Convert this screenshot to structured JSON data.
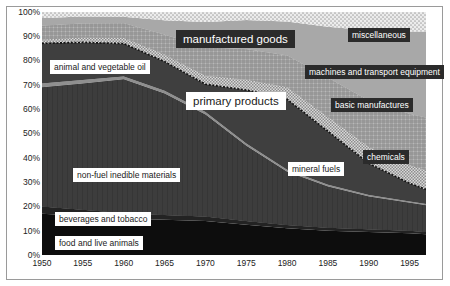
{
  "chart_data": {
    "type": "area",
    "title": "",
    "subtitle": "",
    "xlabel": "",
    "ylabel": "",
    "stacked": "100%",
    "grid": false,
    "legend_position": "inline-annotations",
    "xlim": [
      1950,
      1997
    ],
    "ylim": [
      0,
      100
    ],
    "x": [
      1950,
      1955,
      1960,
      1965,
      1970,
      1975,
      1980,
      1985,
      1990,
      1995,
      1997
    ],
    "xticks": [
      "1950",
      "1955",
      "1960",
      "1965",
      "1970",
      "1975",
      "1980",
      "1985",
      "1990",
      "1995"
    ],
    "ytick_labels": [
      "0%",
      "10%",
      "20%",
      "30%",
      "40%",
      "50%",
      "60%",
      "70%",
      "80%",
      "90%",
      "100%"
    ],
    "yticks": [
      0,
      10,
      20,
      30,
      40,
      50,
      60,
      70,
      80,
      90,
      100
    ],
    "series": [
      {
        "name": "food and live animals",
        "group": "primary products",
        "values": [
          17.0,
          16.0,
          15.0,
          14.5,
          14.0,
          12.5,
          11.0,
          10.0,
          9.5,
          9.0,
          8.5
        ]
      },
      {
        "name": "beverages and tobacco",
        "group": "primary products",
        "values": [
          3.0,
          2.6,
          2.3,
          2.0,
          1.8,
          1.5,
          1.3,
          1.2,
          1.1,
          1.0,
          1.0
        ]
      },
      {
        "name": "non-fuel inedible materials",
        "group": "primary products",
        "values": [
          49.0,
          52.0,
          55.0,
          50.0,
          42.0,
          31.0,
          22.0,
          17.0,
          13.5,
          11.5,
          11.0
        ]
      },
      {
        "name": "animal and vegetable oil",
        "group": "primary products",
        "values": [
          1.6,
          1.4,
          1.2,
          1.1,
          1.0,
          0.9,
          0.8,
          0.7,
          0.6,
          0.5,
          0.5
        ]
      },
      {
        "name": "mineral fuels",
        "group": "primary products",
        "values": [
          16.5,
          15.5,
          13.5,
          12.0,
          11.5,
          22.0,
          29.0,
          22.0,
          13.0,
          7.5,
          6.0
        ]
      },
      {
        "name": "chemicals",
        "group": "manufactured goods",
        "values": [
          1.6,
          2.0,
          2.4,
          3.0,
          3.6,
          4.3,
          5.0,
          6.0,
          6.8,
          7.5,
          8.0
        ]
      },
      {
        "name": "basic manufactures",
        "group": "manufactured goods",
        "values": [
          5.6,
          5.8,
          6.0,
          8.0,
          11.5,
          12.5,
          13.0,
          16.0,
          19.0,
          21.0,
          21.5
        ]
      },
      {
        "name": "machines and transport equipment",
        "group": "manufactured goods",
        "values": [
          3.2,
          2.8,
          2.6,
          6.0,
          10.5,
          12.0,
          14.0,
          21.0,
          29.0,
          34.0,
          35.5
        ]
      },
      {
        "name": "miscellaneous",
        "group": "manufactured goods",
        "values": [
          2.5,
          1.9,
          2.0,
          3.4,
          4.1,
          3.3,
          3.9,
          6.1,
          7.5,
          8.0,
          8.0
        ]
      }
    ],
    "group_labels": [
      "primary products",
      "manufactured goods"
    ],
    "annotations": [
      {
        "text": "manufactured goods",
        "style": "dark"
      },
      {
        "text": "primary products",
        "style": "light"
      },
      {
        "text": "miscellaneous",
        "style": "dark"
      },
      {
        "text": "machines and transport equipment",
        "style": "dark"
      },
      {
        "text": "basic manufactures",
        "style": "dark"
      },
      {
        "text": "chemicals",
        "style": "dark"
      },
      {
        "text": "mineral fuels",
        "style": "light"
      },
      {
        "text": "animal and vegetable oil",
        "style": "light"
      },
      {
        "text": "non-fuel inedible materials",
        "style": "light"
      },
      {
        "text": "beverages and tobacco",
        "style": "light"
      },
      {
        "text": "food and live animals",
        "style": "light"
      }
    ]
  },
  "axes": {
    "y_labels": [
      "100%",
      "90%",
      "80%",
      "70%",
      "60%",
      "50%",
      "40%",
      "30%",
      "20%",
      "10%",
      "0%"
    ],
    "x_labels": [
      "1950",
      "1955",
      "1960",
      "1965",
      "1970",
      "1975",
      "1980",
      "1985",
      "1990",
      "1995"
    ]
  },
  "labels": {
    "manufactured_goods": "manufactured goods",
    "primary_products": "primary products",
    "miscellaneous": "miscellaneous",
    "machines_transport": "machines and transport equipment",
    "basic_manufactures": "basic manufactures",
    "chemicals": "chemicals",
    "mineral_fuels": "mineral fuels",
    "animal_vegetable_oil": "animal and vegetable oil",
    "non_fuel_inedible": "non-fuel inedible materials",
    "beverages_tobacco": "beverages and tobacco",
    "food_live_animals": "food and live animals"
  },
  "colors": {
    "food_live_animals": "#0d0d0d",
    "beverages_tobacco": "#1c1c1c",
    "non_fuel_inedible": "#141414",
    "animal_vegetable_oil": "#8f8f8f",
    "mineral_fuels": "#3a3a3a",
    "chemicals": "#cfcfcf",
    "basic_manufactures": "#8a8a8a",
    "machines_transport": "#a8a8a8",
    "miscellaneous": "#dcdcdc",
    "frame": "#9a9a9a",
    "text": "#222222",
    "label_dark_bg": "#2b2b2b",
    "label_light_bg": "#ffffff"
  }
}
